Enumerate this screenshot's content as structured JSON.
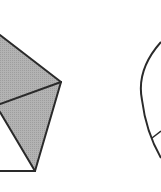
{
  "diagram": {
    "background": "#ffffff",
    "stroke_color": "#2a2a2a",
    "fill_color": "#b3b3b3",
    "figures": [
      {
        "name": "shaded-pentagon-fragment",
        "shaded_regions": [
          {
            "points": "0,35 61,82 0,104"
          },
          {
            "points": "0,104 61,82 35,171 0,112"
          }
        ],
        "unshaded_region": {
          "points": "0,112 35,171 0,171"
        },
        "edges": [
          {
            "x1": 0,
            "y1": 35,
            "x2": 61,
            "y2": 82
          },
          {
            "x1": 0,
            "y1": 104,
            "x2": 61,
            "y2": 82
          },
          {
            "x1": 61,
            "y1": 82,
            "x2": 35,
            "y2": 171
          },
          {
            "x1": 0,
            "y1": 112,
            "x2": 35,
            "y2": 171
          },
          {
            "x1": 0,
            "y1": 171,
            "x2": 35,
            "y2": 171
          }
        ]
      },
      {
        "name": "circle-fragment",
        "arc_path": "M 161 42 Q 136 70 142 100 Q 146 132 161 158",
        "chord": {
          "x1": 152,
          "y1": 138,
          "x2": 161,
          "y2": 131
        }
      }
    ]
  }
}
